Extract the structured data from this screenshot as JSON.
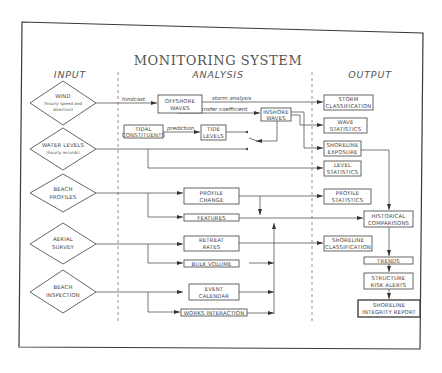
{
  "title": "MONITORING SYSTEM",
  "columns": {
    "input": "INPUT",
    "analysis": "ANALYSIS",
    "output": "OUTPUT"
  },
  "inputs": [
    {
      "line1": "WIND",
      "line2": "(hourly speed and",
      "line3": "direction)"
    },
    {
      "line1": "WATER LEVELS",
      "line2": "(hourly records)"
    },
    {
      "line1": "BEACH",
      "line2": "PROFILES"
    },
    {
      "line1": "AERIAL",
      "line2": "SURVEY"
    },
    {
      "line1": "BEACH",
      "line2": "INSPECTION"
    }
  ],
  "analysis": {
    "offshore_waves": {
      "line1": "OFFSHORE",
      "line2": "WAVES"
    },
    "inshore_waves": {
      "line1": "INSHORE",
      "line2": "WAVES"
    },
    "tidal_constituents": {
      "line1": "TIDAL",
      "line2": "CONSTITUENTS"
    },
    "tide_levels": {
      "line1": "TIDE",
      "line2": "LEVELS"
    },
    "profile_change": {
      "line1": "PROFILE",
      "line2": "CHANGE"
    },
    "features": "FEATURES",
    "retreat_rates": {
      "line1": "RETREAT",
      "line2": "RATES"
    },
    "bulk_volume": "BULK VOLUME",
    "event_calendar": {
      "line1": "EVENT",
      "line2": "CALENDAR"
    },
    "works_interaction": "WORKS INTERACTION"
  },
  "edge_labels": {
    "hindcast": "hindcast",
    "storm_analysis": "storm analysis",
    "transfer_coefficient": "transfer coefficient",
    "prediction": "prediction"
  },
  "outputs": {
    "storm_classification": {
      "line1": "STORM",
      "line2": "CLASSIFICATION"
    },
    "wave_statistics": {
      "line1": "WAVE",
      "line2": "STATISTICS"
    },
    "shoreline_exposure": {
      "line1": "SHORELINE",
      "line2": "EXPOSURE"
    },
    "level_statistics": {
      "line1": "LEVEL",
      "line2": "STATISTICS"
    },
    "profile_statistics": {
      "line1": "PROFILE",
      "line2": "STATISTICS"
    },
    "historical_comparisons": {
      "line1": "HISTORICAL",
      "line2": "COMPARISONS"
    },
    "shoreline_classification": {
      "line1": "SHORELINE",
      "line2": "CLASSIFICATION"
    },
    "trends": "TRENDS",
    "structure_risk_alerts": {
      "line1": "STRUCTURE",
      "line2": "RISK ALERTS"
    },
    "shoreline_integrity_report": {
      "line1": "SHORELINE",
      "line2": "INTEGRITY REPORT"
    }
  }
}
